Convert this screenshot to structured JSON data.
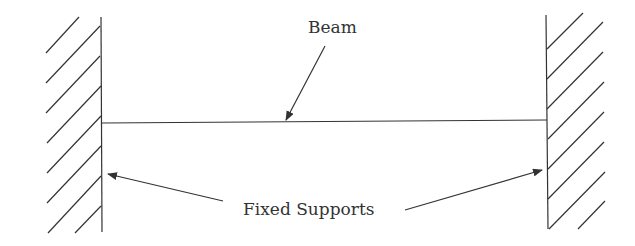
{
  "diagram": {
    "labels": {
      "beam": "Beam",
      "supports": "Fixed Supports"
    },
    "colors": {
      "line": "#333333",
      "background": "#ffffff"
    }
  }
}
